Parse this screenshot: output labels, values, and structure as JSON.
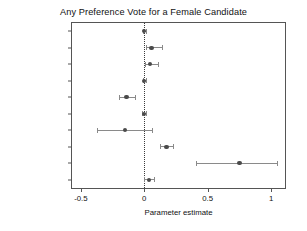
{
  "chart_data": {
    "type": "scatter",
    "title": "Any Preference Vote for a Female Candidate",
    "xlabel": "Parameter estimate",
    "ylabel": "",
    "xlim": [
      -0.57,
      1.11
    ],
    "ylim": [
      0,
      10
    ],
    "grid": false,
    "legend": null,
    "reference_line": 0,
    "xticks": [
      -0.5,
      0,
      0.5,
      1
    ],
    "xticklabels": [
      "-0.5",
      "0",
      "0.5",
      "1"
    ],
    "categories": [
      "Age",
      "Class",
      "Education",
      "Ideology",
      "Party ID",
      "Quota Support",
      "Woman Voter",
      "Incumbent",
      "Party Candidate",
      "Party Centred"
    ],
    "values": [
      0.0,
      0.058,
      0.044,
      0.0,
      -0.14,
      -0.003,
      -0.15,
      0.175,
      0.75,
      0.037
    ],
    "ci_low": [
      -0.012,
      0.012,
      0.008,
      -0.012,
      -0.198,
      -0.018,
      -0.372,
      0.125,
      0.41,
      0.0
    ],
    "ci_high": [
      0.012,
      0.138,
      0.108,
      0.012,
      -0.075,
      0.014,
      0.062,
      0.227,
      1.05,
      0.075
    ],
    "points": [
      {
        "label": "Age",
        "estimate": 0.0,
        "ci_low": -0.012,
        "ci_high": 0.012
      },
      {
        "label": "Class",
        "estimate": 0.058,
        "ci_low": 0.012,
        "ci_high": 0.138
      },
      {
        "label": "Education",
        "estimate": 0.044,
        "ci_low": 0.008,
        "ci_high": 0.108
      },
      {
        "label": "Ideology",
        "estimate": 0.0,
        "ci_low": -0.012,
        "ci_high": 0.012
      },
      {
        "label": "Party ID",
        "estimate": -0.14,
        "ci_low": -0.198,
        "ci_high": -0.075
      },
      {
        "label": "Quota Support",
        "estimate": -0.003,
        "ci_low": -0.018,
        "ci_high": 0.014
      },
      {
        "label": "Woman Voter",
        "estimate": -0.15,
        "ci_low": -0.372,
        "ci_high": 0.062
      },
      {
        "label": "Incumbent",
        "estimate": 0.175,
        "ci_low": 0.125,
        "ci_high": 0.227
      },
      {
        "label": "Party Candidate",
        "estimate": 0.75,
        "ci_low": 0.41,
        "ci_high": 1.05
      },
      {
        "label": "Party Centred",
        "estimate": 0.037,
        "ci_low": 0.0,
        "ci_high": 0.075
      }
    ]
  },
  "colors": {
    "point": "#4a4a4a",
    "whisker": "#8a8a8a",
    "frame": "#555555",
    "reference": "#3a3a3a",
    "background": "#ffffff",
    "text": "#111111"
  }
}
